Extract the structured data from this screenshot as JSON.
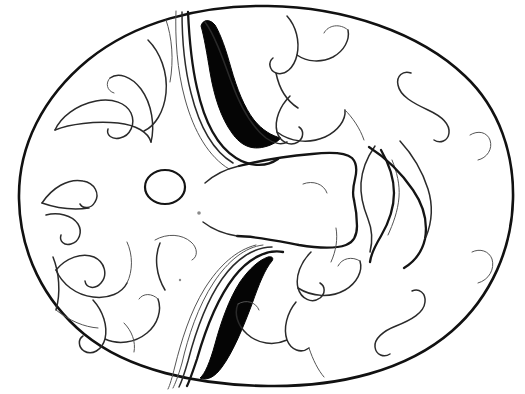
{
  "artwork": {
    "title": "Decorative Mask Line Drawing",
    "medium": "black ink line art on white",
    "canvas": {
      "width": 525,
      "height": 394,
      "background": "#ffffff"
    },
    "palette": {
      "background": "#ffffff",
      "ink_outline": "#111111",
      "ink_fill": "#050505",
      "ink_medium": "#2a2a2a",
      "ink_light": "#6b6b6b"
    },
    "subject": "oval ceremonial mask face with two black crescent eyes, curling flame motifs and a central muzzle ridge",
    "elements": [
      {
        "name": "mask-outline",
        "kind": "closed-oval-contour",
        "note": "large rounded oval filling most of the frame"
      },
      {
        "name": "upper-eye-crescent",
        "kind": "solid-black-crescent",
        "note": "upper-left eye, sickle curving down-right"
      },
      {
        "name": "lower-eye-crescent",
        "kind": "solid-black-crescent",
        "note": "lower-center eye, sickle curving up-right"
      },
      {
        "name": "nostril-circle",
        "kind": "small-open-circle",
        "note": "left of center, mid height"
      },
      {
        "name": "muzzle-ridge",
        "kind": "bone-shaped-band",
        "note": "horizontal bow-tie band across the center-right"
      },
      {
        "name": "flame-scrolls-left",
        "kind": "spiral-curl-group"
      },
      {
        "name": "flame-scrolls-top",
        "kind": "spiral-curl-group"
      },
      {
        "name": "flame-scrolls-bottom",
        "kind": "spiral-curl-group"
      },
      {
        "name": "flame-plumes-right",
        "kind": "wavy-feather-group"
      },
      {
        "name": "s-scroll-top-right",
        "kind": "s-curve"
      },
      {
        "name": "s-scroll-bottom-right",
        "kind": "s-curve"
      },
      {
        "name": "ink-speck",
        "kind": "stray-dot"
      }
    ]
  }
}
